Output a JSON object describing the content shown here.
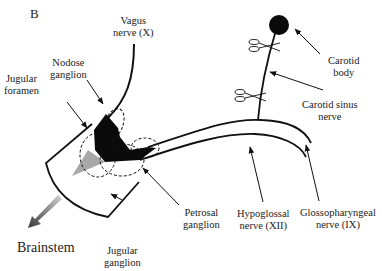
{
  "panel_label": "B",
  "labels": {
    "vagus": [
      "Vagus",
      "nerve (X)"
    ],
    "nodose": [
      "Nodose",
      "ganglion"
    ],
    "jugular_foramen": [
      "Jugular",
      "foramen"
    ],
    "carotid_body": [
      "Carotid",
      "body"
    ],
    "carotid_sinus": [
      "Carotid sinus",
      "nerve"
    ],
    "petrosal": [
      "Petrosal",
      "ganglion"
    ],
    "hypoglossal": [
      "Hypoglossal",
      "nerve (XII)"
    ],
    "glossopharyngeal": [
      "Glossopharyngeal",
      "nerve (IX)"
    ],
    "jugular_ganglion": [
      "Jugular",
      "ganglion"
    ],
    "brainstem": "Brainstem"
  },
  "icons": {
    "scissors": "scissors-icon",
    "carotid_body": "filled-circle",
    "brainstem_arrow": "gradient-arrow"
  },
  "colors": {
    "ink": "#111111",
    "ganglion_dark": "#0a0a0a",
    "ganglion_grey": "#a8a8a8",
    "arrow_gradient_start": "#444444",
    "arrow_gradient_end": "#c8c8c8"
  }
}
